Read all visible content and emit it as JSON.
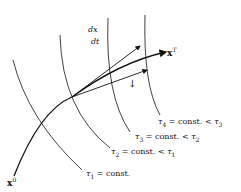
{
  "diagram": {
    "labels": {
      "dx": "dx",
      "dt": "dt",
      "xT_base": "x",
      "xT_sup": "T",
      "x0_base": "x",
      "x0_sup": "0",
      "tau1": {
        "sym": "τ",
        "sub": "1",
        "text": " = const."
      },
      "tau2": {
        "sym": "τ",
        "sub": "2",
        "text": " = const. < ",
        "rhs_sym": "τ",
        "rhs_sub": "1"
      },
      "tau3": {
        "sym": "τ",
        "sub": "3",
        "text": " = const. < ",
        "rhs_sym": "τ",
        "rhs_sub": "2"
      },
      "tau4": {
        "sym": "τ",
        "sub": "4",
        "text": " = const. < ",
        "rhs_sym": "τ",
        "rhs_sub": "3"
      },
      "small_arrow": "↓"
    },
    "colors": {
      "stroke": "#111111",
      "background": "#ffffff"
    }
  }
}
